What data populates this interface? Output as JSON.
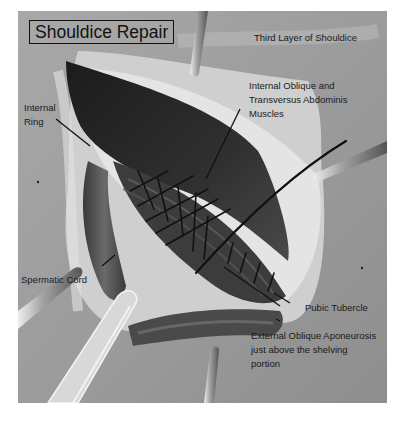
{
  "figure": {
    "title": "Shouldice Repair",
    "subtitle": "Third Layer of Shouldice",
    "labels": {
      "internal_ring": [
        "Internal",
        "Ring"
      ],
      "muscles": [
        "Internal Oblique and",
        "Transversus Abdominis",
        "Muscles"
      ],
      "spermatic_cord": "Spermatic Cord",
      "pubic_tubercle": "Pubic Tubercle",
      "aponeurosis": [
        "External Oblique Aponeurosis",
        "just above the shelving",
        "portion"
      ]
    },
    "colors": {
      "background_tissue": "#9a9a9a",
      "dark_muscle": "#2b2b2b",
      "light_tissue": "#d6d6d6",
      "suture": "#111111",
      "label_text": "#1a1a1a"
    }
  }
}
